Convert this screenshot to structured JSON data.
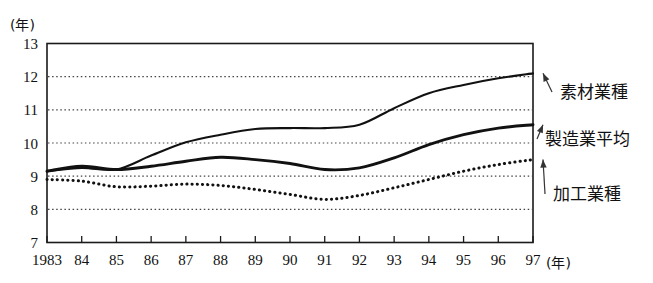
{
  "chart_data": {
    "type": "line",
    "title": "",
    "xlabel": "(年)",
    "ylabel": "(年)",
    "xlim": [
      1983,
      1997
    ],
    "ylim": [
      7,
      13
    ],
    "grid": true,
    "legend_position": "right-outside-annotations",
    "x": [
      1983,
      1984,
      1985,
      1986,
      1987,
      1988,
      1989,
      1990,
      1991,
      1992,
      1993,
      1994,
      1995,
      1996,
      1997
    ],
    "categories": [
      "1983",
      "84",
      "85",
      "86",
      "87",
      "88",
      "89",
      "90",
      "91",
      "92",
      "93",
      "94",
      "95",
      "96",
      "97"
    ],
    "y_ticks": [
      "7",
      "8",
      "9",
      "10",
      "11",
      "12",
      "13"
    ],
    "series": [
      {
        "name": "素材業種",
        "style": "solid",
        "values": [
          9.15,
          9.25,
          9.2,
          9.62,
          10.02,
          10.25,
          10.42,
          10.45,
          10.45,
          10.55,
          11.05,
          11.5,
          11.75,
          11.95,
          12.1
        ]
      },
      {
        "name": "製造業平均",
        "style": "solid-thick",
        "values": [
          9.15,
          9.3,
          9.2,
          9.3,
          9.45,
          9.57,
          9.5,
          9.38,
          9.2,
          9.25,
          9.55,
          9.95,
          10.25,
          10.45,
          10.55
        ]
      },
      {
        "name": "加工業種",
        "style": "dotted",
        "values": [
          8.9,
          8.85,
          8.68,
          8.7,
          8.76,
          8.72,
          8.6,
          8.45,
          8.3,
          8.42,
          8.65,
          8.9,
          9.15,
          9.35,
          9.5
        ]
      }
    ],
    "annotations": [
      {
        "label": "素材業種",
        "points_to_series": "素材業種",
        "points_to_x": 1997
      },
      {
        "label": "製造業平均",
        "points_to_series": "製造業平均",
        "points_to_x": 1997
      },
      {
        "label": "加工業種",
        "points_to_series": "加工業種",
        "points_to_x": 1997
      }
    ]
  }
}
